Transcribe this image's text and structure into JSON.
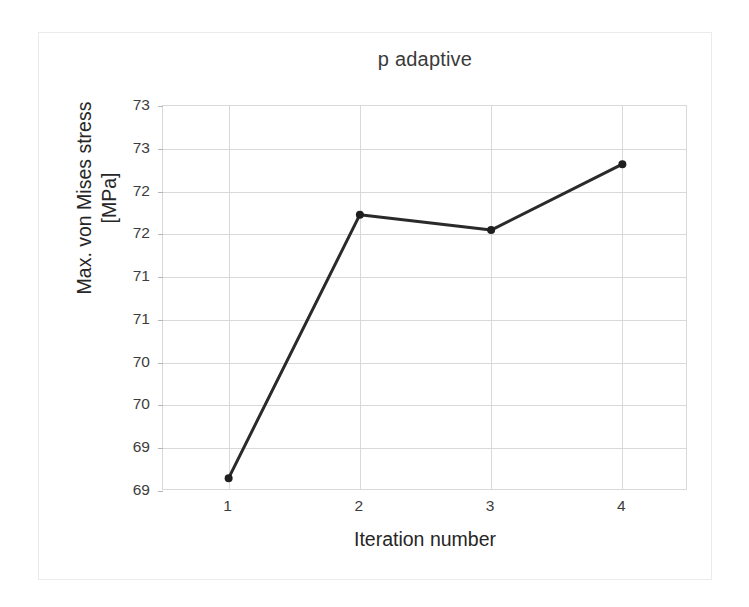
{
  "figure": {
    "background_color": "#ffffff",
    "frame_color": "#ebebeb"
  },
  "chart_data": {
    "type": "line",
    "title": "p adaptive",
    "xlabel": "Iteration number",
    "ylabel": "Max. von Mises stress\n[MPa]",
    "x": [
      1,
      2,
      3,
      4
    ],
    "values": [
      69.15,
      72.23,
      72.05,
      72.82
    ],
    "series": [
      {
        "name": "Max. von Mises stress",
        "x": [
          1,
          2,
          3,
          4
        ],
        "values": [
          69.15,
          72.23,
          72.05,
          72.82
        ]
      }
    ],
    "xlim": [
      0.5,
      4.5
    ],
    "ylim": [
      69.0,
      73.5
    ],
    "xtick_labels": [
      "1",
      "2",
      "3",
      "4"
    ],
    "xtick_values": [
      1,
      2,
      3,
      4
    ],
    "ytick_labels": [
      "73",
      "73",
      "72",
      "72",
      "71",
      "71",
      "70",
      "70",
      "69",
      "69"
    ],
    "ytick_values": [
      73.5,
      73.0,
      72.5,
      72.0,
      71.5,
      71.0,
      70.5,
      70.0,
      69.5,
      69.0
    ],
    "grid": true,
    "grid_color": "#d9d9d9",
    "legend": false,
    "legend_position": "none",
    "line_color": "#2a2a2a",
    "line_width": 3,
    "marker": "circle",
    "marker_color": "#1f1f1f",
    "marker_size": 8
  }
}
